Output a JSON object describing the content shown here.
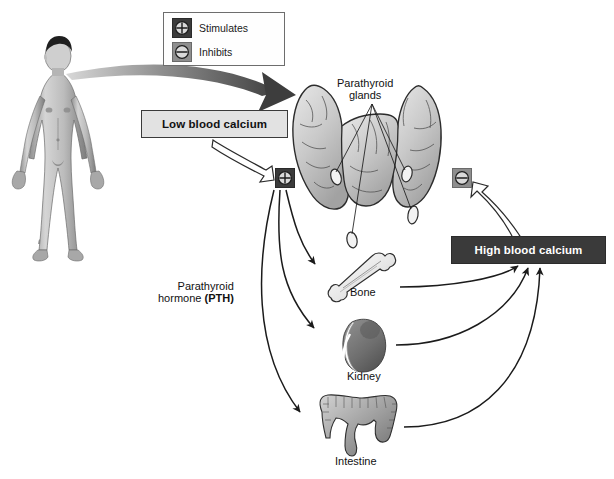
{
  "diagram": {
    "topic": "Parathyroid hormone regulation of blood calcium",
    "background_color": "#ffffff"
  },
  "legend": {
    "items": [
      {
        "icon": "plus-circle-icon",
        "label": "Stimulates",
        "symbol": "+",
        "chip_color": "#3b3b3b"
      },
      {
        "icon": "minus-circle-icon",
        "label": "Inhibits",
        "symbol": "−",
        "chip_color": "#8e8e8e"
      }
    ]
  },
  "boxes": {
    "low_calcium": {
      "label": "Low blood calcium",
      "fill": "#e2e2e2",
      "border": "#3a3a3a",
      "text_color": "#111111"
    },
    "high_calcium": {
      "label": "High blood calcium",
      "fill": "#3a3a3a",
      "border": "#2b2b2b",
      "text_color": "#ffffff"
    }
  },
  "labels": {
    "parathyroid_glands_line1": "Parathyroid",
    "parathyroid_glands_line2": "glands",
    "pth_line1": "Parathyroid",
    "pth_line2_plain": "hormone ",
    "pth_line2_bold": "(PTH)",
    "bone": "Bone",
    "kidney": "Kidney",
    "intestine": "Intestine"
  },
  "markers": {
    "stimulate_on_gland": {
      "icon": "plus-circle-icon",
      "symbol": "+"
    },
    "inhibit_on_gland": {
      "icon": "minus-circle-icon",
      "symbol": "−"
    }
  },
  "figures": {
    "human_body": "male-anatomical-figure",
    "thyroid": "thyroid-gland-with-parathyroid-glands",
    "organs": [
      "bone-femur",
      "kidney",
      "large-intestine"
    ]
  },
  "flow": {
    "arrows": [
      {
        "from": "human-body-neck",
        "to": "thyroid-gland",
        "style": "thick-gray-gradient"
      },
      {
        "from": "low-blood-calcium",
        "to": "stimulate-marker",
        "style": "hollow-outline"
      },
      {
        "from": "high-blood-calcium",
        "to": "inhibit-marker",
        "style": "hollow-outline"
      },
      {
        "from": "thyroid-gland",
        "to": "bone",
        "style": "thin-curved"
      },
      {
        "from": "thyroid-gland",
        "to": "kidney",
        "style": "thin-curved"
      },
      {
        "from": "thyroid-gland",
        "to": "intestine",
        "style": "thin-curved"
      },
      {
        "from": "bone",
        "to": "high-blood-calcium",
        "style": "thin-curved"
      },
      {
        "from": "kidney",
        "to": "high-blood-calcium",
        "style": "thin-curved"
      },
      {
        "from": "intestine",
        "to": "high-blood-calcium",
        "style": "thin-curved"
      }
    ]
  }
}
